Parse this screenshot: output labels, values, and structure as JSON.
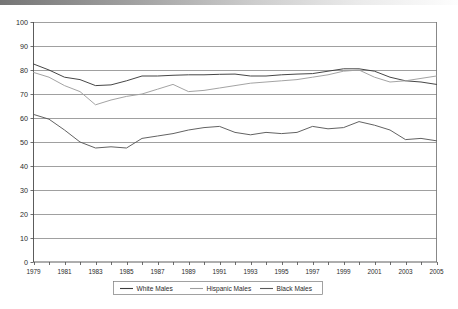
{
  "chart_data": {
    "type": "line",
    "title": "",
    "subtitle": "",
    "xlabel": "",
    "ylabel": "",
    "ylim": [
      0,
      100
    ],
    "ytick_step": 10,
    "yticks": [
      "0",
      "10",
      "20",
      "30",
      "40",
      "50",
      "60",
      "70",
      "80",
      "90",
      "100"
    ],
    "xlim": [
      1979,
      2005
    ],
    "xticks_all": [
      1979,
      1980,
      1981,
      1982,
      1983,
      1984,
      1985,
      1986,
      1987,
      1988,
      1989,
      1990,
      1991,
      1992,
      1993,
      1994,
      1995,
      1996,
      1997,
      1998,
      1999,
      2000,
      2001,
      2002,
      2003,
      2004,
      2005
    ],
    "xtick_labels": [
      "1979",
      "1981",
      "1983",
      "1985",
      "1987",
      "1989",
      "1991",
      "1993",
      "1995",
      "1997",
      "1999",
      "2001",
      "2003",
      "2005"
    ],
    "x": [
      1979,
      1980,
      1981,
      1982,
      1983,
      1984,
      1985,
      1986,
      1987,
      1988,
      1989,
      1990,
      1991,
      1992,
      1993,
      1994,
      1995,
      1996,
      1997,
      1998,
      1999,
      2000,
      2001,
      2002,
      2003,
      2004,
      2005
    ],
    "grid": true,
    "grid_axis": "y",
    "legend_position": "bottom",
    "series": [
      {
        "name": "White Males",
        "color": "#3c3c3c",
        "values": [
          82.5,
          80.0,
          77.0,
          76.0,
          73.5,
          73.8,
          75.5,
          77.5,
          77.5,
          77.8,
          78.0,
          78.0,
          78.2,
          78.3,
          77.5,
          77.5,
          78.0,
          78.3,
          78.5,
          79.5,
          80.5,
          80.5,
          79.5,
          77.0,
          75.5,
          75.0,
          74.0
        ]
      },
      {
        "name": "Hispanic Males",
        "color": "#9e9e9e",
        "values": [
          79.0,
          77.0,
          73.5,
          71.0,
          65.5,
          67.5,
          69.0,
          70.0,
          72.0,
          74.0,
          71.0,
          71.5,
          72.5,
          73.5,
          74.5,
          75.0,
          75.5,
          76.0,
          77.0,
          78.0,
          79.5,
          80.0,
          77.0,
          75.0,
          75.5,
          76.5,
          77.5
        ]
      },
      {
        "name": "Black Males",
        "color": "#5a5a5a",
        "values": [
          61.5,
          59.5,
          55.0,
          50.0,
          47.5,
          48.0,
          47.5,
          51.5,
          52.5,
          53.5,
          55.0,
          56.0,
          56.5,
          54.0,
          53.0,
          54.0,
          53.5,
          54.0,
          56.5,
          55.5,
          56.0,
          58.5,
          57.0,
          55.0,
          51.0,
          51.5,
          50.5
        ]
      }
    ]
  },
  "legend": {
    "items": [
      {
        "label": "White Males",
        "color": "#3c3c3c"
      },
      {
        "label": "Hispanic Males",
        "color": "#9e9e9e"
      },
      {
        "label": "Black Males",
        "color": "#5a5a5a"
      }
    ]
  }
}
